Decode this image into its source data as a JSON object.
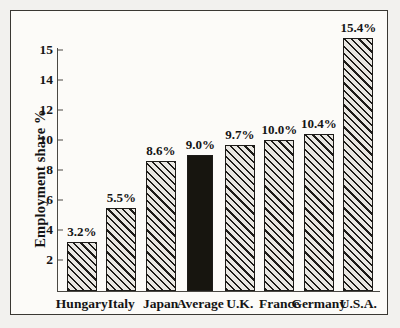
{
  "chart_data": {
    "type": "bar",
    "title": "",
    "xlabel": "",
    "ylabel": "Employment share %",
    "categories": [
      "Hungary",
      "Italy",
      "Japan",
      "Average",
      "U.K.",
      "France",
      "Germany",
      "U.S.A."
    ],
    "values": [
      3.2,
      5.5,
      8.6,
      9.0,
      9.7,
      10.0,
      10.4,
      15.4
    ],
    "value_labels": [
      "3.2%",
      "5.5%",
      "8.6%",
      "9.0%",
      "9.7%",
      "10.0%",
      "10.4%",
      "15.4%"
    ],
    "ytick_labels": [
      "15",
      "14",
      "12",
      "10",
      "8",
      "6",
      "4",
      "2"
    ],
    "ytick_values": [
      15,
      14,
      12,
      10,
      8,
      6,
      4,
      2
    ],
    "ylim": [
      0,
      15.4
    ],
    "grid": false,
    "legend": null,
    "series": [
      {
        "name": "Employment share %",
        "values": [
          3.2,
          5.5,
          8.6,
          9.0,
          9.7,
          10.0,
          10.4,
          15.4
        ]
      }
    ],
    "bar_styles": [
      "hatch",
      "hatch",
      "hatch",
      "solid",
      "hatch",
      "hatch",
      "hatch",
      "hatch"
    ],
    "highlight_category": "Average",
    "colors": {
      "bar_hatch_fill": "#e9e7e2",
      "bar_hatch_line": "#1d1b18",
      "bar_highlight": "#17150f",
      "axis": "#4a4843",
      "text": "#141414",
      "frame": "#3a3833",
      "page_background": "#f2f1ee",
      "plot_background": "#fcfbf8"
    }
  }
}
